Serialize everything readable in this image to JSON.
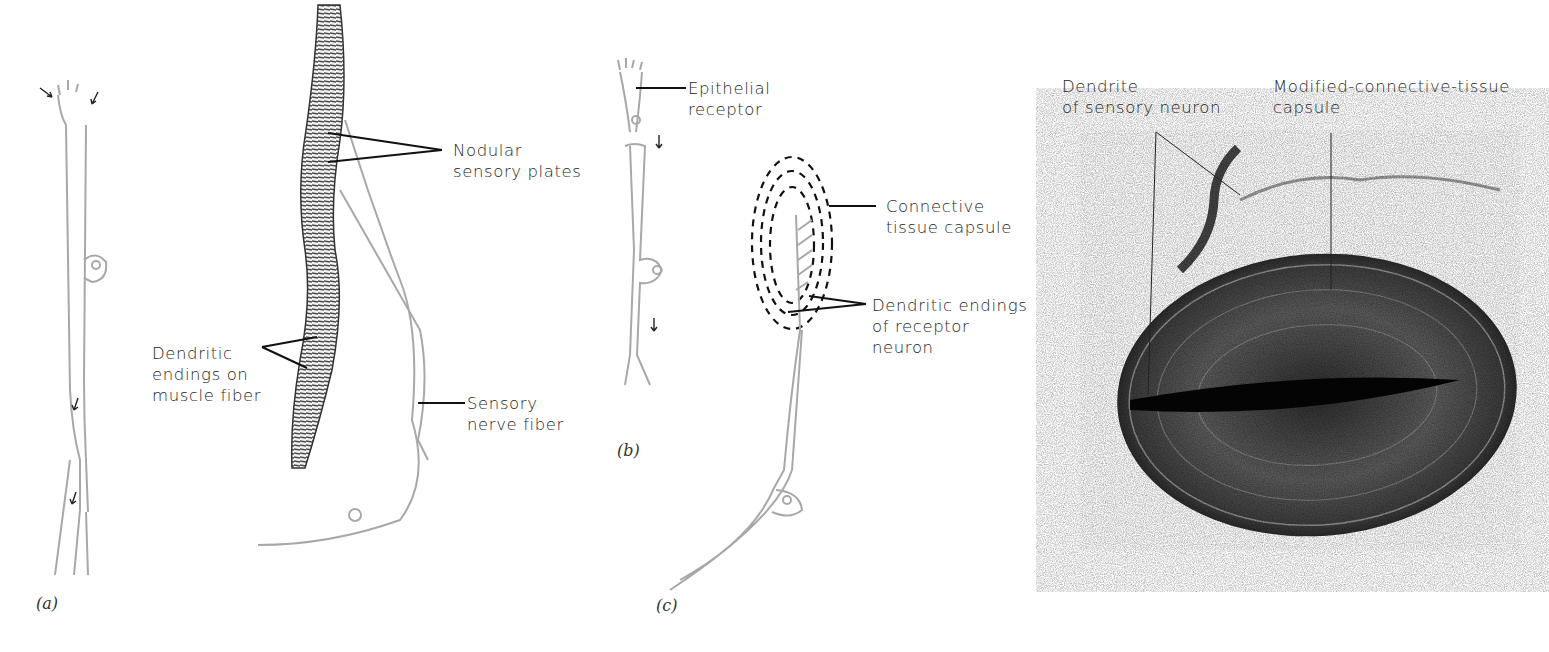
{
  "figure": {
    "panels": [
      {
        "id": "a",
        "label": "(a)"
      },
      {
        "id": "b",
        "label": "(b)"
      },
      {
        "id": "c",
        "label": "(c)"
      }
    ],
    "labels": {
      "nodular_1": "Nodular",
      "nodular_2": "sensory plates",
      "dendritic_muscle_1": "Dendritic",
      "dendritic_muscle_2": "endings on",
      "dendritic_muscle_3": "muscle fiber",
      "sensory_nerve_1": "Sensory",
      "sensory_nerve_2": "nerve fiber",
      "epithelial_1": "Epithelial",
      "epithelial_2": "receptor",
      "capsule_1": "Connective",
      "capsule_2": "tissue capsule",
      "dendritic_receptor_1": "Dendritic endings",
      "dendritic_receptor_2": "of receptor",
      "dendritic_receptor_3": "neuron",
      "photo_dendrite_1": "Dendrite",
      "photo_dendrite_2": "of sensory neuron",
      "photo_capsule_1": "Modified-connective-tissue",
      "photo_capsule_2": "capsule"
    },
    "colors": {
      "neuron_outline": "#a8a8a8",
      "leader_line": "#111111",
      "muscle_fiber": "#555555",
      "photo_dark": "#1a1a1a"
    }
  }
}
